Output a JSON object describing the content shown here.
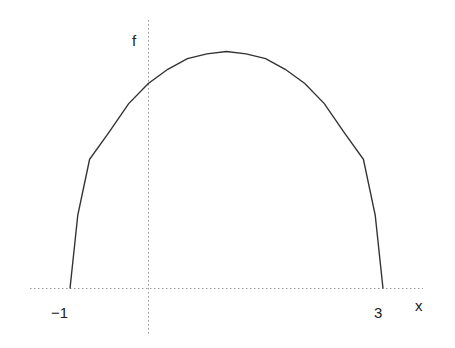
{
  "chart_data": {
    "type": "line",
    "title": "",
    "xlabel": "x",
    "ylabel": "f",
    "x_ticks": [
      "-1",
      "3"
    ],
    "x_tick_labels": [
      "−1",
      "3"
    ],
    "xlim": [
      -1.5,
      3.5
    ],
    "ylim": [
      -0.35,
      2.3
    ],
    "grid": false,
    "axes_style": "dotted",
    "series": [
      {
        "name": "f",
        "color": "#333333",
        "x": [
          -1,
          -0.9,
          -0.75,
          -0.5,
          -0.25,
          0,
          0.25,
          0.5,
          0.75,
          1,
          1.25,
          1.5,
          1.75,
          2,
          2.25,
          2.5,
          2.75,
          2.9,
          3
        ],
        "y": [
          0,
          0.62,
          1.09,
          1.32,
          1.56,
          1.73,
          1.85,
          1.94,
          1.98,
          2.0,
          1.98,
          1.94,
          1.85,
          1.73,
          1.56,
          1.32,
          1.09,
          0.62,
          0
        ]
      }
    ],
    "annotations": []
  },
  "labels": {
    "y_axis": "f",
    "x_axis": "x",
    "tick_neg1": "−1",
    "tick_3": "3"
  }
}
